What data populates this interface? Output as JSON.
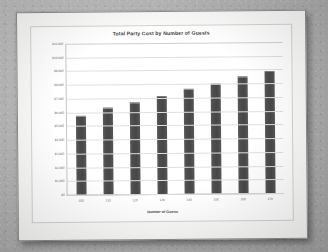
{
  "document": {
    "kind": "printed-page-photo",
    "page_background": "#fbfbfa",
    "desk_background": "#b9b9b9"
  },
  "chart_data": {
    "type": "bar",
    "title": "Total Party Cost by Number of Guests",
    "xlabel": "Number of Guests",
    "ylabel": "",
    "categories": [
      "100",
      "110",
      "120",
      "130",
      "140",
      "150",
      "160",
      "170"
    ],
    "values": [
      5700,
      6250,
      6600,
      7100,
      7550,
      7950,
      8450,
      8800
    ],
    "ylim": [
      0,
      11000
    ],
    "ytick_labels": [
      "$11,000",
      "$10,000",
      "$9,000",
      "$8,000",
      "$7,000",
      "$6,000",
      "$5,000",
      "$4,000",
      "$3,000",
      "$2,000",
      "$1,000",
      "$0"
    ],
    "ytick_values": [
      11000,
      10000,
      9000,
      8000,
      7000,
      6000,
      5000,
      4000,
      3000,
      2000,
      1000,
      0
    ],
    "grid": true,
    "legend": false,
    "series_color": "#4d4d4d",
    "gridline_color": "#dfdfdf",
    "plot_background": "#ffffff"
  }
}
